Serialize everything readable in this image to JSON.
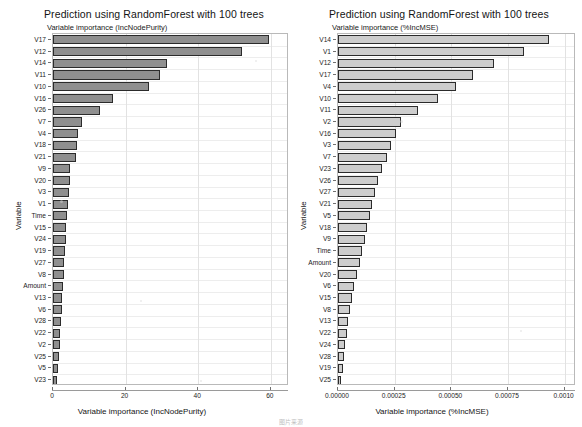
{
  "figure": {
    "caption": "图片来源"
  },
  "chart_data": [
    {
      "type": "bar",
      "orientation": "horizontal",
      "title": "Prediction using RandomForest with 100 trees",
      "subtitle": "Variable importance (IncNodePurity)",
      "xlabel": "Variable importance (IncNodePurity)",
      "ylabel": "Variable",
      "xlim": [
        0,
        65
      ],
      "xticks": [
        0,
        20,
        40,
        60
      ],
      "xticklabels": [
        "0",
        "20",
        "40",
        "60"
      ],
      "grid": true,
      "legend": "none",
      "bar_color": "#8f8f8f",
      "categories": [
        "V17",
        "V12",
        "V14",
        "V11",
        "V10",
        "V16",
        "V26",
        "V7",
        "V4",
        "V18",
        "V21",
        "V9",
        "V20",
        "V3",
        "V1",
        "Time",
        "V15",
        "V24",
        "V19",
        "V27",
        "V8",
        "Amount",
        "V13",
        "V6",
        "V28",
        "V22",
        "V2",
        "V25",
        "V5",
        "V23"
      ],
      "values": [
        59.5,
        52.0,
        31.5,
        29.5,
        26.5,
        16.5,
        13.0,
        8.0,
        7.0,
        6.6,
        6.2,
        4.8,
        4.6,
        4.4,
        4.2,
        3.9,
        3.7,
        3.5,
        3.3,
        3.1,
        3.0,
        2.8,
        2.6,
        2.4,
        2.2,
        2.0,
        1.8,
        1.6,
        1.4,
        1.2
      ]
    },
    {
      "type": "bar",
      "orientation": "horizontal",
      "title": "Prediction using RandomForest with 100 trees",
      "subtitle": "Variable importance (%IncMSE)",
      "xlabel": "Variable importance (%IncMSE)",
      "ylabel": "Variable",
      "xlim": [
        0,
        0.00105
      ],
      "xticks": [
        0,
        0.00025,
        0.0005,
        0.00075,
        0.001
      ],
      "xticklabels": [
        "0.00000",
        "0.00025",
        "0.00050",
        "0.00075",
        "0.0010"
      ],
      "grid": true,
      "legend": "none",
      "bar_color": "#cdcdcd",
      "categories": [
        "V14",
        "V1",
        "V12",
        "V17",
        "V4",
        "V10",
        "V11",
        "V2",
        "V16",
        "V3",
        "V7",
        "V23",
        "V26",
        "V27",
        "V21",
        "V5",
        "V18",
        "V9",
        "Time",
        "Amount",
        "V20",
        "V6",
        "V15",
        "V8",
        "V13",
        "V22",
        "V24",
        "V28",
        "V19",
        "V25"
      ],
      "values": [
        0.00093,
        0.00082,
        0.00069,
        0.000595,
        0.00052,
        0.00044,
        0.000355,
        0.00028,
        0.000255,
        0.000235,
        0.000215,
        0.000195,
        0.000178,
        0.000162,
        0.00015,
        0.00014,
        0.000128,
        0.000118,
        0.000108,
        9.8e-05,
        8.6e-05,
        7.2e-05,
        6e-05,
        5.2e-05,
        4.5e-05,
        3.8e-05,
        3.2e-05,
        2.6e-05,
        2e-05,
        1.3e-05
      ]
    }
  ]
}
